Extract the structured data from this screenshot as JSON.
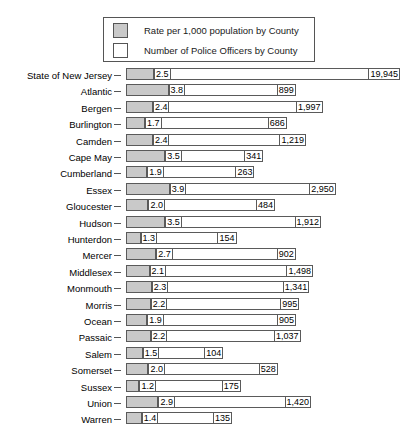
{
  "legend": {
    "items": [
      {
        "swatch_color": "#c9c9c9",
        "label": "Rate per 1,000 population by County"
      },
      {
        "swatch_color": "#ffffff",
        "label": "Number of Police Officers by County"
      }
    ]
  },
  "chart_data": {
    "type": "bar",
    "title": "",
    "xlabel": "",
    "ylabel": "",
    "orientation": "horizontal",
    "grid": false,
    "legend_position": "top",
    "categories": [
      "State of New Jersey",
      "Atlantic",
      "Bergen",
      "Burlington",
      "Camden",
      "Cape May",
      "Cumberland",
      "Essex",
      "Gloucester",
      "Hudson",
      "Hunterdon",
      "Mercer",
      "Middlesex",
      "Monmouth",
      "Morris",
      "Ocean",
      "Passaic",
      "Salem",
      "Somerset",
      "Sussex",
      "Union",
      "Warren"
    ],
    "series": [
      {
        "name": "Rate per 1,000 population by County",
        "color": "#c9c9c9",
        "values": [
          2.5,
          3.8,
          2.4,
          1.7,
          2.4,
          3.5,
          1.9,
          3.9,
          2.0,
          3.5,
          1.3,
          2.7,
          2.1,
          2.3,
          2.2,
          1.9,
          2.2,
          1.5,
          2.0,
          1.2,
          2.9,
          1.4
        ],
        "labels": [
          "2.5",
          "3.8",
          "2.4",
          "1.7",
          "2.4",
          "3.5",
          "1.9",
          "3.9",
          "2.0",
          "3.5",
          "1.3",
          "2.7",
          "2.1",
          "2.3",
          "2.2",
          "1.9",
          "2.2",
          "1.5",
          "2.0",
          "1.2",
          "2.9",
          "1.4"
        ]
      },
      {
        "name": "Number of Police Officers by County",
        "color": "#ffffff",
        "values": [
          19945,
          899,
          1997,
          686,
          1219,
          341,
          263,
          2950,
          484,
          1912,
          154,
          902,
          1498,
          1341,
          995,
          905,
          1037,
          104,
          528,
          175,
          1420,
          135
        ],
        "labels": [
          "19,945",
          "899",
          "1,997",
          "686",
          "1,219",
          "341",
          "263",
          "2,950",
          "484",
          "1,912",
          "154",
          "902",
          "1,498",
          "1,341",
          "995",
          "905",
          "1,037",
          "104",
          "528",
          "175",
          "1,420",
          "135"
        ]
      }
    ]
  }
}
